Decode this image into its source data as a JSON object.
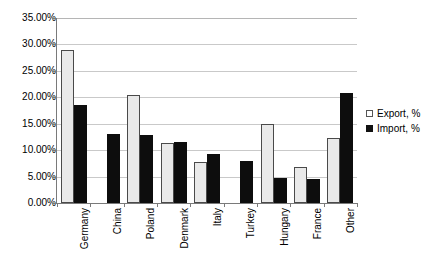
{
  "chart_data": {
    "type": "bar",
    "title": "",
    "xlabel": "",
    "ylabel": "",
    "ylim": [
      0,
      35
    ],
    "ytick_step": 5,
    "ytick_labels": [
      "0.00%",
      "5.00%",
      "10.00%",
      "15.00%",
      "20.00%",
      "25.00%",
      "30.00%",
      "35.00%"
    ],
    "ytick_values": [
      0,
      5,
      10,
      15,
      20,
      25,
      30,
      35
    ],
    "grid": true,
    "legend_position": "right",
    "categories": [
      "Germany",
      "China",
      "Poland",
      "Denmark",
      "Italy",
      "Turkey",
      "Hungary",
      "France",
      "Other"
    ],
    "series": [
      {
        "name": "Export, %",
        "color": "#e9e9e9",
        "values": [
          29.0,
          0.0,
          20.5,
          11.3,
          7.8,
          0.0,
          15.0,
          6.8,
          12.3
        ]
      },
      {
        "name": "Import, %",
        "color": "#0d0d0d",
        "values": [
          18.5,
          13.0,
          12.8,
          11.5,
          9.2,
          8.0,
          4.8,
          4.6,
          20.8
        ]
      }
    ]
  },
  "legend": {
    "items": [
      {
        "label": "Export, %",
        "swatch": "export"
      },
      {
        "label": "Import, %",
        "swatch": "import"
      }
    ]
  }
}
